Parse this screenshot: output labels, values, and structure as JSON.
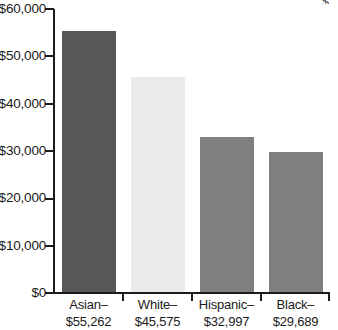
{
  "chart_data": {
    "type": "bar",
    "title": "",
    "subtitle": "",
    "xlabel": "",
    "ylabel": "",
    "grid": false,
    "legend": false,
    "ylim": [
      0,
      60000
    ],
    "ytick_step": 10000,
    "ytick_labels": [
      "$60,000",
      "$50,000",
      "$40,000",
      "$30,000",
      "$20,000",
      "$10,000",
      "$0"
    ],
    "ytick_values": [
      60000,
      50000,
      40000,
      30000,
      20000,
      10000,
      0
    ],
    "categories": [
      "Asian",
      "White",
      "Hispanic",
      "Black"
    ],
    "values": [
      55262,
      45575,
      32997,
      29689
    ],
    "value_labels": [
      "$55,262",
      "$45,575",
      "$32,997",
      "$29,689"
    ],
    "tick_labels": [
      {
        "category": "Asian–",
        "value": "$55,262"
      },
      {
        "category": "White–",
        "value": "$45,575"
      },
      {
        "category": "Hispanic–",
        "value": "$32,997"
      },
      {
        "category": "Black–",
        "value": "$29,689"
      }
    ],
    "bar_colors": [
      "#575757",
      "#eaeaea",
      "#808080",
      "#808080"
    ],
    "axis_color": "#1b1b1b",
    "background": "#ffffff"
  },
  "artifacts": {
    "top_right_partial_glyph": "$"
  }
}
